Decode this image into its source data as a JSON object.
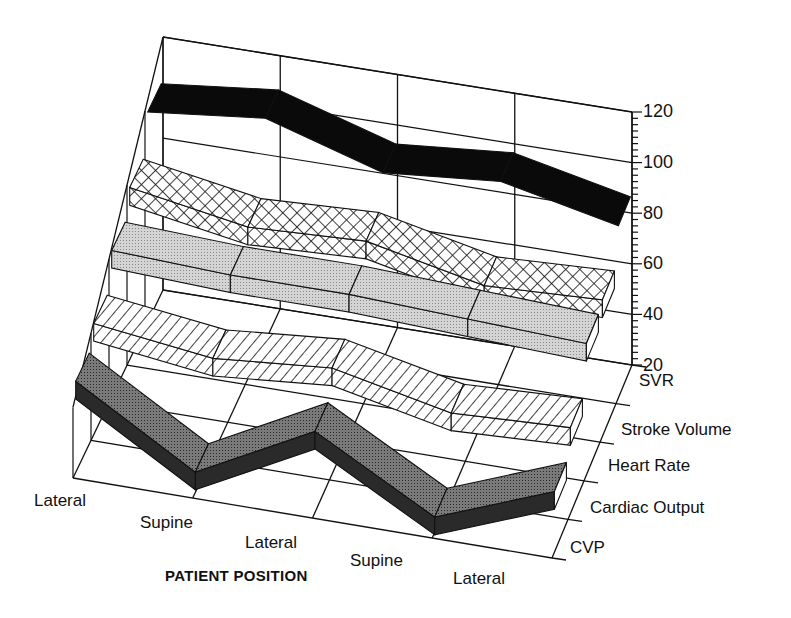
{
  "chart_data": {
    "type": "3d-ribbon-line",
    "title": "",
    "xlabel": "PATIENT POSITION",
    "ylabel": "",
    "categories": [
      "Lateral",
      "Supine",
      "Lateral",
      "Supine",
      "Lateral"
    ],
    "y_ticks": [
      120,
      100,
      80,
      60,
      40,
      20
    ],
    "ylim": [
      20,
      120
    ],
    "depth_labels": [
      "SVR",
      "Stroke Volume",
      "Heart Rate",
      "Cardiac Output",
      "CVP"
    ],
    "grid": true,
    "legend": "none (series labeled along depth axis)",
    "series": [
      {
        "name": "SVR",
        "values": [
          103,
          108,
          94,
          98,
          88
        ],
        "fill": "solid-black"
      },
      {
        "name": "Stroke Volume",
        "values": [
          88,
          80,
          82,
          72,
          74
        ],
        "fill": "crosshatch"
      },
      {
        "name": "Heart Rate",
        "values": [
          78,
          76,
          76,
          74,
          72
        ],
        "fill": "light-stipple"
      },
      {
        "name": "Cardiac Output",
        "values": [
          64,
          58,
          62,
          52,
          54
        ],
        "fill": "diagonal-hatch"
      },
      {
        "name": "CVP",
        "values": [
          56,
          28,
          52,
          26,
          44
        ],
        "fill": "dark-stipple"
      }
    ]
  },
  "labels": {
    "x_title": "PATIENT POSITION",
    "x_cat_0": "Lateral",
    "x_cat_1": "Supine",
    "x_cat_2": "Lateral",
    "x_cat_3": "Supine",
    "x_cat_4": "Lateral",
    "y_120": "120",
    "y_100": "100",
    "y_80": "80",
    "y_60": "60",
    "y_40": "40",
    "y_20": "20",
    "depth_0": "SVR",
    "depth_1": "Stroke Volume",
    "depth_2": "Heart Rate",
    "depth_3": "Cardiac Output",
    "depth_4": "CVP"
  },
  "colors": {
    "ink": "#111111",
    "svr": "#0a0a0a",
    "stroke_volume_bg": "#ffffff",
    "heart_rate": "#c8c8c8",
    "cardiac_output_bg": "#ffffff",
    "cvp_top": "#6a6a6a",
    "cvp_side": "#2a2a2a"
  }
}
